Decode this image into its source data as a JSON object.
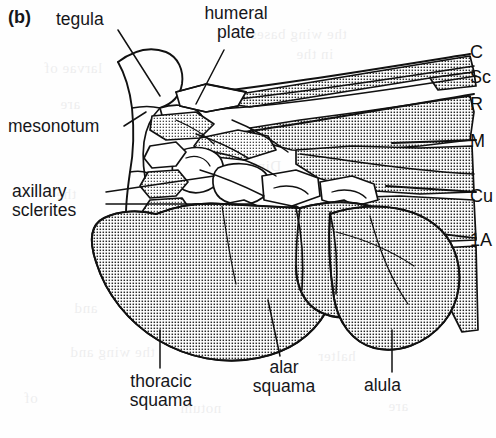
{
  "figure": {
    "panel_label": "(b)",
    "background_color": "#fefefe",
    "ink_color": "#111111",
    "stipple_color": "#2a2a2a"
  },
  "labels": {
    "tegula": "tegula",
    "humeral_plate_line1": "humeral",
    "humeral_plate_line2": "plate",
    "mesonotum": "mesonotum",
    "axillary_line1": "axillary",
    "axillary_line2": "sclerites",
    "thoracic_line1": "thoracic",
    "thoracic_line2": "squama",
    "alar_line1": "alar",
    "alar_line2": "squama",
    "alula": "alula"
  },
  "veins": [
    {
      "name": "C",
      "label": "C",
      "y": 52
    },
    {
      "name": "Sc",
      "label": "Sc",
      "y": 77
    },
    {
      "name": "R",
      "label": "R",
      "y": 104
    },
    {
      "name": "M",
      "label": "M",
      "y": 141
    },
    {
      "name": "Cu",
      "label": "Cu",
      "y": 196
    },
    {
      "name": "1A",
      "label": "1A",
      "y": 240
    }
  ],
  "bleed_text": [
    {
      "text": "the wing bases",
      "x": 250,
      "y": 26
    },
    {
      "text": "in the",
      "x": 296,
      "y": 46
    },
    {
      "text": "larvae of",
      "x": 44,
      "y": 60
    },
    {
      "text": "are",
      "x": 60,
      "y": 96
    },
    {
      "text": "of the",
      "x": 330,
      "y": 116
    },
    {
      "text": "Diptera",
      "x": 232,
      "y": 158
    },
    {
      "text": "the",
      "x": 56,
      "y": 186
    },
    {
      "text": "flight",
      "x": 300,
      "y": 200
    },
    {
      "text": "THE",
      "x": 352,
      "y": 216
    },
    {
      "text": "squamae",
      "x": 152,
      "y": 262
    },
    {
      "text": "and",
      "x": 74,
      "y": 300
    },
    {
      "text": "in",
      "x": 286,
      "y": 312
    },
    {
      "text": "the wing and",
      "x": 70,
      "y": 344
    },
    {
      "text": "halter",
      "x": 318,
      "y": 348
    },
    {
      "text": "of",
      "x": 24,
      "y": 390
    },
    {
      "text": "notum",
      "x": 180,
      "y": 400
    },
    {
      "text": "are",
      "x": 388,
      "y": 398
    }
  ]
}
